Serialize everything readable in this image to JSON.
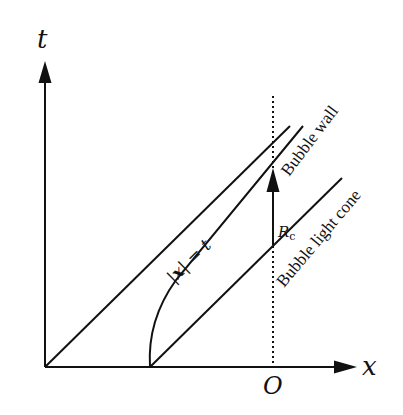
{
  "diagram": {
    "type": "spacetime-diagram",
    "axes": {
      "vertical_label": "t",
      "horizontal_label": "x",
      "origin_marker_label": "O"
    },
    "lines": {
      "light_cone_origin": {
        "label": "|x| = t",
        "label_bold_var": "x"
      },
      "bubble_wall": {
        "label": "Bubble wall"
      },
      "bubble_light_cone": {
        "label": "Bubble light cone"
      }
    },
    "arrow_annotation": {
      "label": "R",
      "subscript": "c"
    },
    "colors": {
      "stroke": "#111111",
      "background": "#ffffff"
    }
  }
}
